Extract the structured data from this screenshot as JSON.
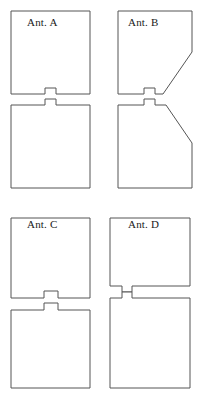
{
  "figure": {
    "width": 201,
    "height": 404,
    "background_color": "#ffffff",
    "stroke_color": "#555555",
    "stroke_width": 1,
    "fill_color": "#ffffff"
  },
  "panels": [
    {
      "id": "panel-a",
      "label": "Ant. A",
      "description": "Two identical square patches separated by a narrow horizontal gap; each patch has a small rectangular stub protruding toward the gap at the horizontal centre.",
      "upper_patch": {
        "shape": "square-with-center-stub",
        "x": 11,
        "y": 11,
        "width": 79,
        "height": 83,
        "stub": {
          "width": 11,
          "height": 6,
          "position": "bottom-center"
        }
      },
      "lower_patch": {
        "shape": "square-with-center-stub",
        "x": 11,
        "y": 105,
        "width": 79,
        "height": 83,
        "stub": {
          "width": 11,
          "height": 6,
          "position": "top-center"
        }
      },
      "gap": {
        "height": 5,
        "position": "center"
      }
    },
    {
      "id": "panel-b",
      "label": "Ant. B",
      "description": "Same stub-fed pair as Ant. A, but the facing inner corners are truncated by long diagonal chamfers on the right-hand side, forming a bow-tie / tapered slot.",
      "upper_patch": {
        "shape": "square-with-center-stub-and-diagonal-chamfer",
        "x": 11,
        "y": 11,
        "width": 81,
        "height": 83,
        "stub": {
          "width": 11,
          "height": 6,
          "position": "bottom-center"
        },
        "chamfer": {
          "from": [
            92,
            52
          ],
          "to": [
            63,
            94
          ],
          "side": "right"
        }
      },
      "lower_patch": {
        "shape": "square-with-center-stub-and-diagonal-chamfer",
        "x": 11,
        "y": 105,
        "width": 81,
        "height": 83,
        "stub": {
          "width": 11,
          "height": 6,
          "position": "top-center"
        },
        "chamfer": {
          "from": [
            66,
            105
          ],
          "to": [
            92,
            143
          ],
          "side": "right"
        }
      },
      "gap": {
        "height": 5,
        "position": "center"
      }
    },
    {
      "id": "panel-c",
      "label": "Ant. C",
      "description": "Two square patches with centred rectangular stubs, like Ant. A but with a slightly wider stub and marginally larger gap.",
      "upper_patch": {
        "shape": "square-with-center-stub",
        "x": 11,
        "y": 16,
        "width": 79,
        "height": 80,
        "stub": {
          "width": 14,
          "height": 7,
          "position": "bottom-center"
        }
      },
      "lower_patch": {
        "shape": "square-with-center-stub",
        "x": 11,
        "y": 108,
        "width": 79,
        "height": 78,
        "stub": {
          "width": 14,
          "height": 7,
          "position": "top-center"
        }
      },
      "gap": {
        "height": 5,
        "position": "center"
      }
    },
    {
      "id": "panel-d",
      "label": "Ant. D",
      "description": "Stub-fed pair in which both stubs extend to the right into a wide rectangular arm, producing an interdigital / offset feed region.",
      "upper_patch": {
        "shape": "square-with-extended-right-arm",
        "x": 11,
        "y": 16,
        "width": 79,
        "height": 80,
        "stub": {
          "width": 10,
          "height": 7,
          "position": "bottom-center"
        },
        "arm": {
          "x": 32,
          "y": 84,
          "width": 58,
          "height": 12,
          "side": "right"
        }
      },
      "lower_patch": {
        "shape": "square-with-center-stub",
        "x": 11,
        "y": 108,
        "width": 79,
        "height": 78,
        "stub": {
          "width": 10,
          "height": 7,
          "position": "top-center"
        }
      },
      "gap": {
        "height": 5,
        "position": "center"
      }
    }
  ]
}
